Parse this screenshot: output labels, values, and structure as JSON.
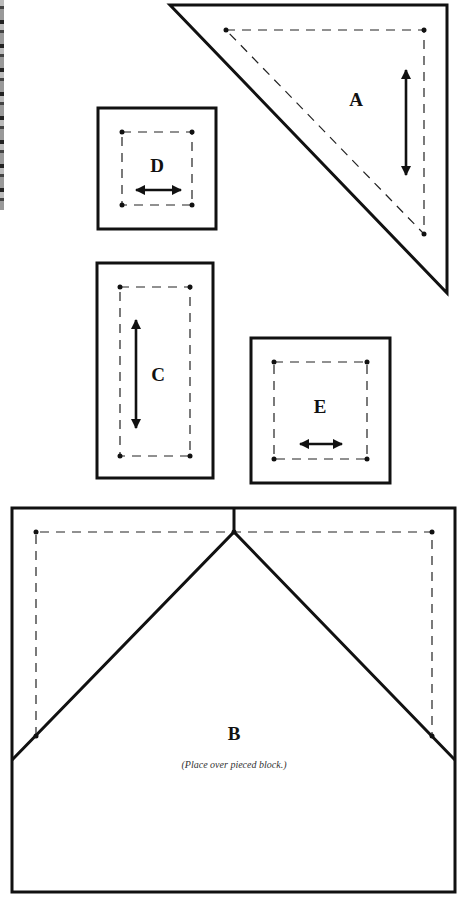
{
  "figure": {
    "type": "quilt-pattern-templates",
    "pieces": [
      {
        "id": "A",
        "label": "A",
        "shape": "right-triangle",
        "grain": "vertical"
      },
      {
        "id": "B",
        "label": "B",
        "shape": "rectangle-with-pieced-peak",
        "grain": "none",
        "note": "(Place over pieced block.)"
      },
      {
        "id": "C",
        "label": "C",
        "shape": "rectangle",
        "grain": "vertical"
      },
      {
        "id": "D",
        "label": "D",
        "shape": "square",
        "grain": "horizontal"
      },
      {
        "id": "E",
        "label": "E",
        "shape": "square",
        "grain": "horizontal"
      }
    ]
  },
  "labels": {
    "a": "A",
    "b": "B",
    "c": "C",
    "d": "D",
    "e": "E",
    "b_note": "(Place over pieced block.)"
  },
  "colors": {
    "line": "#111111",
    "background": "#ffffff"
  }
}
